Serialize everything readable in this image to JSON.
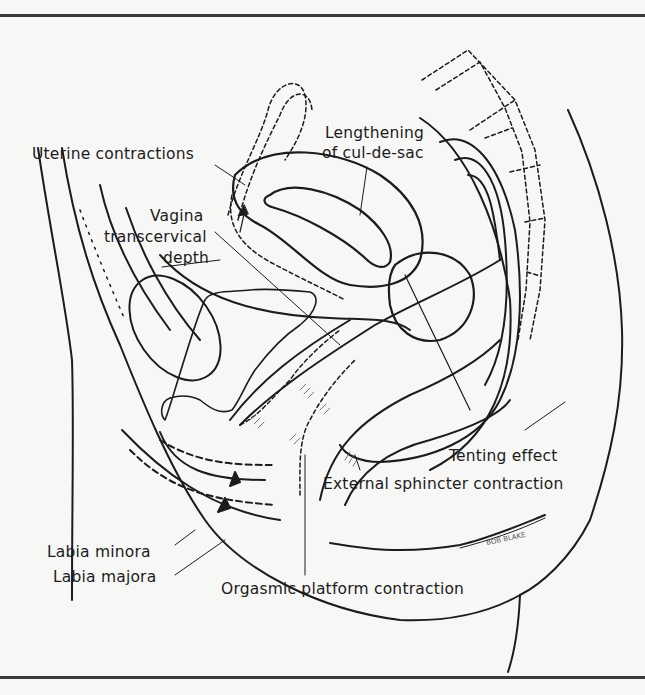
{
  "figure": {
    "type": "anatomical line drawing (sagittal section)",
    "labels": {
      "uterine_contractions": "Uterine contractions",
      "lengthening_line1": "Lengthening",
      "lengthening_line2": "of cul-de-sac",
      "vagina_line1": "Vagina",
      "vagina_line2": "transcervical",
      "vagina_line3": "depth",
      "tenting_effect": "Tenting effect",
      "external_sphincter": "External sphincter contraction",
      "labia_minora": "Labia minora",
      "labia_majora": "Labia majora",
      "orgasmic_platform": "Orgasmic platform contraction"
    },
    "signature": "BOB BLAKE",
    "colors": {
      "ink": "#1c1c1c",
      "paper": "#f7f7f5",
      "rule": "#3a3a3a"
    }
  }
}
